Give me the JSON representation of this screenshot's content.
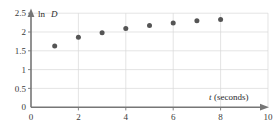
{
  "chart_data": {
    "type": "scatter",
    "title": "",
    "subtitle": "",
    "xlabel": "t (seconds)",
    "xlabel_italic_part": "t",
    "xlabel_rest": "(seconds)",
    "ylabel": "ln D",
    "ylabel_plain_part": "ln",
    "ylabel_italic_part": "D",
    "x": [
      1,
      2,
      3,
      4,
      5,
      6,
      7,
      8
    ],
    "values": [
      1.63,
      1.86,
      1.98,
      2.09,
      2.17,
      2.24,
      2.3,
      2.33
    ],
    "series": [
      {
        "name": "ln D",
        "values": [
          1.63,
          1.86,
          1.98,
          2.09,
          2.17,
          2.24,
          2.3,
          2.33
        ]
      }
    ],
    "xlim": [
      0,
      10
    ],
    "ylim": [
      0,
      2.5
    ],
    "xticks": [
      0,
      2,
      4,
      6,
      8,
      10
    ],
    "xtick_labels": [
      "0",
      "2",
      "4",
      "6",
      "8",
      "10"
    ],
    "yticks": [
      0,
      0.5,
      1,
      1.5,
      2,
      2.5
    ],
    "ytick_labels": [
      "0",
      "0.5",
      "1",
      "1.5",
      "2",
      "2.5"
    ],
    "grid": true,
    "grid_color": "#d8d8d8",
    "legend": "none",
    "marker": "circle",
    "marker_color": "#555555",
    "axis_color": "#767676",
    "x_axis_arrow": true,
    "y_axis_arrow": true
  }
}
